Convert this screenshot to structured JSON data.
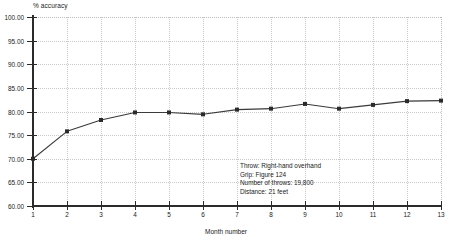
{
  "chart_data": {
    "type": "line",
    "title": "",
    "xlabel": "Month number",
    "ylabel": "% accuracy",
    "x": [
      1,
      2,
      3,
      4,
      5,
      6,
      7,
      8,
      9,
      10,
      11,
      12,
      13
    ],
    "values": [
      70.0,
      75.8,
      78.2,
      79.8,
      79.8,
      79.4,
      80.4,
      80.6,
      81.6,
      80.6,
      81.4,
      82.2,
      82.3
    ],
    "series": [
      {
        "name": "% accuracy",
        "values": [
          70.0,
          75.8,
          78.2,
          79.8,
          79.8,
          79.4,
          80.4,
          80.6,
          81.6,
          80.6,
          81.4,
          82.2,
          82.3
        ]
      }
    ],
    "xlim": [
      1,
      13
    ],
    "ylim": [
      60.0,
      100.0
    ],
    "y_ticks": [
      60.0,
      65.0,
      70.0,
      75.0,
      80.0,
      85.0,
      90.0,
      95.0,
      100.0
    ],
    "y_tick_labels": [
      "60.00",
      "65.00",
      "70.00",
      "75.00",
      "80.00",
      "85.00",
      "90.00",
      "95.00",
      "100.00"
    ],
    "x_ticks": [
      1,
      2,
      3,
      4,
      5,
      6,
      7,
      8,
      9,
      10,
      11,
      12,
      13
    ],
    "x_tick_labels": [
      "1",
      "2",
      "3",
      "4",
      "5",
      "6",
      "7",
      "8",
      "9",
      "10",
      "11",
      "12",
      "13"
    ],
    "grid": true,
    "legend": "none",
    "marker": "square",
    "line_color": "#3a3a3a",
    "marker_color": "#2b2b2b",
    "grid_color": "#c9c9c9",
    "axis_color": "#2b2b2b",
    "background": "#ffffff"
  },
  "annotation": {
    "lines": [
      "Throw: Right-hand overhand",
      "Grip: Figure 124",
      "Number of throws: 19,800",
      "Distance: 21 feet"
    ],
    "line_1": "Throw: Right-hand overhand",
    "line_2": "Grip: Figure 124",
    "line_3": "Number of throws: 19,800",
    "line_4": "Distance: 21 feet"
  }
}
